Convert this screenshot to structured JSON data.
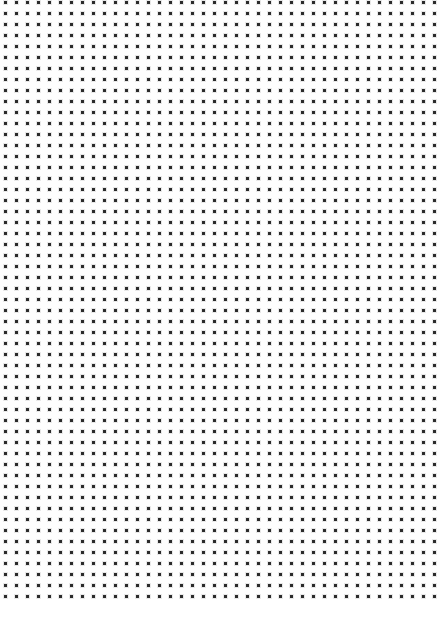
{
  "page": {
    "width": 440,
    "height": 629,
    "background_color": "#ffffff",
    "paper_color": "#fefefe",
    "title": "Dot Grid Paper"
  },
  "dot_grid": {
    "dot_color": "#2b2b2b",
    "dot_halo_color": "#cfcfcf",
    "dot_size": 3,
    "halo_size": 5,
    "spacing_x": 11,
    "spacing_y": 11,
    "origin_x": 4,
    "origin_y": 1,
    "columns": 40,
    "rows": 55,
    "shape": "square"
  },
  "bottom_margin": {
    "top": 600,
    "height": 29,
    "color": "#ffffff"
  }
}
